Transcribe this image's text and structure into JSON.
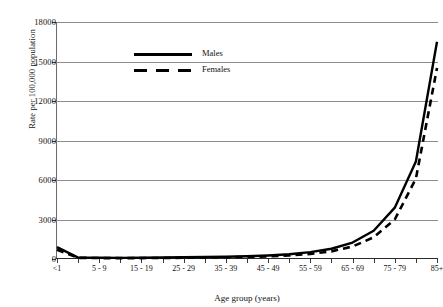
{
  "chart_data": {
    "type": "line",
    "title": "",
    "xlabel": "Age group (years)",
    "ylabel": "Rate per 100,000 population",
    "ylim": [
      0,
      18000
    ],
    "grid": "horizontal",
    "legend_position": "top-left",
    "categories": [
      "<1",
      "1 - 4",
      "5 - 9",
      "10 - 14",
      "15 - 19",
      "20 - 24",
      "25 - 29",
      "30 - 34",
      "35 - 39",
      "40 - 44",
      "45 - 49",
      "50 - 54",
      "55 - 59",
      "60 - 64",
      "65 - 69",
      "70 - 74",
      "75 - 79",
      "80 - 84",
      "85+"
    ],
    "ytick_labels": [
      "0",
      "3000",
      "6000",
      "9000",
      "12000",
      "15000",
      "18000"
    ],
    "ytick_values": [
      0,
      3000,
      6000,
      9000,
      12000,
      15000,
      18000
    ],
    "xtick_labels_shown": [
      "<1",
      "",
      "5 - 9",
      "",
      "15 - 19",
      "",
      "25 - 29",
      "",
      "35 - 39",
      "",
      "45 - 49",
      "",
      "55 - 59",
      "",
      "65 - 69",
      "",
      "75 - 79",
      "",
      "85+"
    ],
    "series": [
      {
        "name": "Males",
        "style": "solid",
        "color": "#000000",
        "values": [
          900,
          110,
          90,
          85,
          95,
          110,
          130,
          150,
          175,
          210,
          270,
          360,
          520,
          780,
          1250,
          2150,
          3900,
          7400,
          16500
        ]
      },
      {
        "name": "Females",
        "style": "dashed",
        "color": "#000000",
        "values": [
          700,
          90,
          70,
          65,
          70,
          80,
          95,
          110,
          130,
          160,
          200,
          270,
          390,
          580,
          950,
          1650,
          3000,
          6100,
          14500
        ]
      }
    ]
  },
  "legend": {
    "items": [
      {
        "label": "Males",
        "style": "solid"
      },
      {
        "label": "Females",
        "style": "dashed"
      }
    ]
  }
}
